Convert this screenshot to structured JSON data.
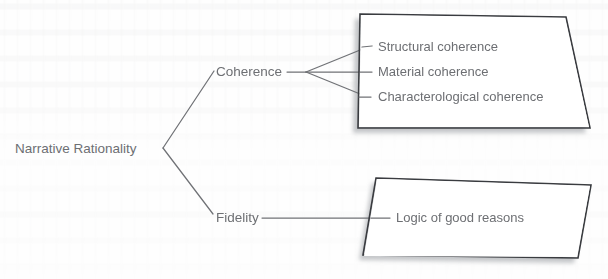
{
  "diagram": {
    "type": "tree-diagram",
    "title_text": "Narrative Rationality",
    "text_color": "#6d6f73",
    "line_color": "#707276",
    "box_border_color": "#3a3c40",
    "box_fill_color": "#ffffff",
    "shadow_color": "#b9bbbe",
    "background_color": "#fefefe",
    "root": {
      "label": "Narrative Rationality"
    },
    "branches": [
      {
        "label": "Coherence",
        "children": [
          {
            "label": "Structural coherence"
          },
          {
            "label": "Material coherence"
          },
          {
            "label": "Characterological coherence"
          }
        ]
      },
      {
        "label": "Fidelity",
        "children": [
          {
            "label": "Logic of good reasons"
          }
        ]
      }
    ],
    "boxes": [
      {
        "name": "coherence-box",
        "items": [
          "Structural coherence",
          "Material coherence",
          "Characterological coherence"
        ]
      },
      {
        "name": "fidelity-box",
        "items": [
          "Logic of good reasons"
        ]
      }
    ]
  }
}
